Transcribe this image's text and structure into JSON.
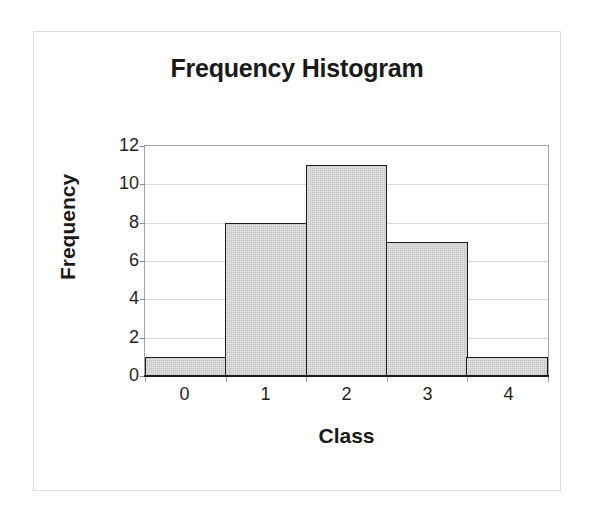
{
  "chart_data": {
    "type": "bar",
    "title": "Frequency Histogram",
    "xlabel": "Class",
    "ylabel": "Frequency",
    "categories": [
      "0",
      "1",
      "2",
      "3",
      "4"
    ],
    "values": [
      1,
      8,
      11,
      7,
      1
    ],
    "ylim": [
      0,
      12
    ],
    "ytick_labels": [
      "12",
      "10",
      "8",
      "6",
      "4",
      "2",
      "0"
    ],
    "ytick_values": [
      12,
      10,
      8,
      6,
      4,
      2,
      0
    ],
    "ystep": 2,
    "grid": "horizontal",
    "legend": "none",
    "bar_gap": "none",
    "bar_fill_color": "#c6c6c6",
    "bar_border_color": "#1c1c1c",
    "gridline_color": "#d9d9d9",
    "plot_border_color": "#a6a6a6",
    "frame_border_color": "#dcdcdc",
    "background_color": "#ffffff"
  }
}
